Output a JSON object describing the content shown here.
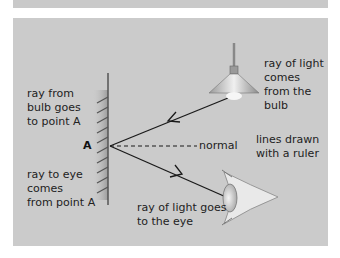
{
  "figure": {
    "labels": {
      "ray_from_bulb": "ray from\nbulb goes\nto point A",
      "ray_to_eye": "ray to eye\ncomes\nfrom point A",
      "point": "A",
      "normal": "normal",
      "ray_of_light_comes": "ray of light\ncomes\nfrom the\nbulb",
      "lines_drawn": "lines drawn\nwith a ruler",
      "ray_goes_to_eye": "ray of light goes\nto the eye"
    },
    "objects": [
      "plane-mirror",
      "lamp-bulb",
      "eye"
    ],
    "colors": {
      "background": "#cbcbcb",
      "ray": "#1a1a1a",
      "mirror": "#555555"
    }
  }
}
